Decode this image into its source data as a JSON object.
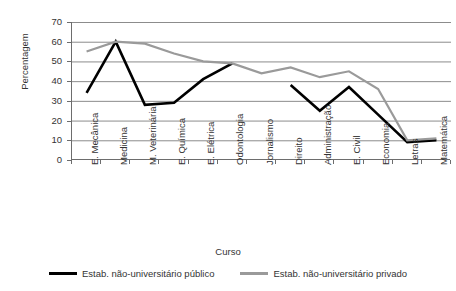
{
  "chart_data": {
    "type": "line",
    "title": "",
    "xlabel": "Curso",
    "ylabel": "Percentagem",
    "ylim": [
      0,
      70
    ],
    "ytick_step": 10,
    "grid": true,
    "legend_position": "bottom",
    "categories": [
      "E. Mecânica",
      "Medicina",
      "M. Veterinária",
      "E. Química",
      "E. Elétrica",
      "Odontologia",
      "Jornalismo",
      "Direito",
      "Administração",
      "E. Civil",
      "Economia",
      "Letras",
      "Matemática"
    ],
    "yticks": [
      "0",
      "10",
      "20",
      "30",
      "40",
      "50",
      "60",
      "70"
    ],
    "series": [
      {
        "name": "Estab. não-universitário público",
        "color": "#000000",
        "values": [
          34,
          60,
          28,
          29,
          41,
          49,
          null,
          38,
          25,
          37,
          23,
          9,
          10
        ]
      },
      {
        "name": "Estab. não-universitário privado",
        "color": "#9a9a9a",
        "values": [
          55,
          60,
          59,
          54,
          50,
          49,
          44,
          47,
          42,
          45,
          36,
          10,
          11
        ]
      }
    ]
  }
}
